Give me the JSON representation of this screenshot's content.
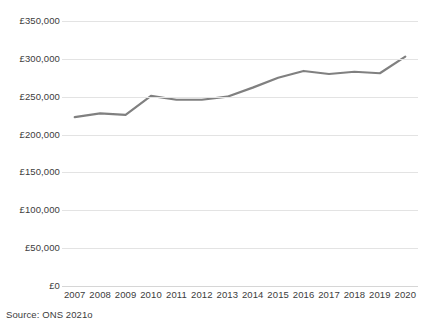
{
  "chart_data": {
    "type": "line",
    "title": "",
    "subtitle": "",
    "xlabel": "",
    "ylabel": "",
    "categories": [
      "2007",
      "2008",
      "2009",
      "2010",
      "2011",
      "2012",
      "2013",
      "2014",
      "2015",
      "2016",
      "2017",
      "2018",
      "2019",
      "2020"
    ],
    "values": [
      223000,
      228000,
      226000,
      251000,
      246000,
      246000,
      250000,
      262000,
      275000,
      284000,
      280000,
      283000,
      281000,
      303000
    ],
    "series": [
      {
        "name": "Average house price",
        "values": [
          223000,
          228000,
          226000,
          251000,
          246000,
          246000,
          250000,
          262000,
          275000,
          284000,
          280000,
          283000,
          281000,
          303000
        ]
      }
    ],
    "ylim": [
      0,
      350000
    ],
    "ytick_values": [
      0,
      50000,
      100000,
      150000,
      200000,
      250000,
      300000,
      350000
    ],
    "ytick_labels": [
      "£0",
      "£50,000",
      "£100,000",
      "£150,000",
      "£200,000",
      "£250,000",
      "£300,000",
      "£350,000"
    ],
    "xtick_labels": [
      "2007",
      "2008",
      "2009",
      "2010",
      "2011",
      "2012",
      "2013",
      "2014",
      "2015",
      "2016",
      "2017",
      "2018",
      "2019",
      "2020"
    ],
    "grid": true,
    "grid_axis": "y",
    "legend": false,
    "legend_position": "none",
    "annotations": [],
    "line_color": "#808080",
    "grid_color": "#e3e3e3",
    "text_color": "#3c3c3c",
    "background_color": "#ffffff"
  },
  "footer": {
    "source_note": "Source: ONS 2021o"
  }
}
